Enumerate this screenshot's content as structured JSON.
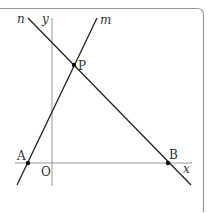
{
  "diagram": {
    "frame": {
      "color": "#9a9a9a"
    },
    "axes": {
      "x_label": "x",
      "y_label": "y",
      "origin_label": "O"
    },
    "lines": [
      {
        "name": "m",
        "label": "m"
      },
      {
        "name": "n",
        "label": "n"
      }
    ],
    "points": [
      {
        "name": "P",
        "label": "P"
      },
      {
        "name": "A",
        "label": "A"
      },
      {
        "name": "B",
        "label": "B"
      }
    ],
    "colors": {
      "line": "#222222",
      "axis": "#999999",
      "point": "#111111"
    }
  }
}
